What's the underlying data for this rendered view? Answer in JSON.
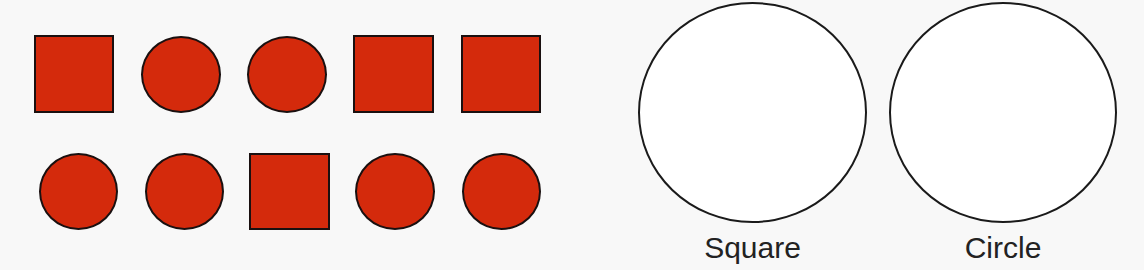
{
  "colors": {
    "shape_fill": "#d42a0c",
    "shape_outline": "#1a1010",
    "background": "#f8f8f8",
    "sort_outline": "#1a1a1a"
  },
  "shapes": {
    "rows": [
      [
        {
          "type": "square",
          "x": 34,
          "y": 35,
          "w": 80,
          "h": 78
        },
        {
          "type": "circle",
          "x": 141,
          "y": 36,
          "w": 80,
          "h": 77
        },
        {
          "type": "circle",
          "x": 247,
          "y": 36,
          "w": 80,
          "h": 77
        },
        {
          "type": "square",
          "x": 353,
          "y": 35,
          "w": 81,
          "h": 78
        },
        {
          "type": "square",
          "x": 461,
          "y": 35,
          "w": 80,
          "h": 78
        }
      ],
      [
        {
          "type": "circle",
          "x": 39,
          "y": 153,
          "w": 79,
          "h": 77
        },
        {
          "type": "circle",
          "x": 145,
          "y": 153,
          "w": 79,
          "h": 77
        },
        {
          "type": "square",
          "x": 249,
          "y": 153,
          "w": 81,
          "h": 77
        },
        {
          "type": "circle",
          "x": 355,
          "y": 153,
          "w": 80,
          "h": 77
        },
        {
          "type": "circle",
          "x": 462,
          "y": 153,
          "w": 79,
          "h": 77
        }
      ]
    ]
  },
  "sorting": {
    "groups": [
      {
        "label": "Square",
        "x": 638,
        "y": 2,
        "w": 229,
        "h": 221
      },
      {
        "label": "Circle",
        "x": 889,
        "y": 2,
        "w": 228,
        "h": 221
      }
    ]
  }
}
